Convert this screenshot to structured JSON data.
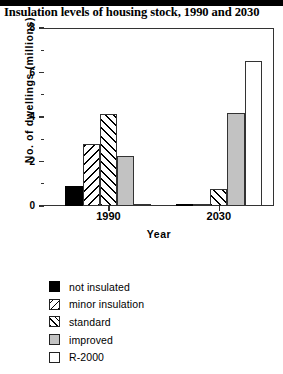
{
  "title": "Insulation levels of housing stock, 1990 and 2030",
  "chart_data": {
    "type": "bar",
    "title": "Insulation levels of housing stock, 1990 and 2030",
    "xlabel": "Year",
    "ylabel": "No.  of  dwellings  (millions)",
    "categories": [
      "1990",
      "2030"
    ],
    "ylim": [
      0,
      8
    ],
    "yticks": [
      "0",
      "2",
      "4",
      "6",
      "8"
    ],
    "ytick_values": [
      0,
      2,
      4,
      6,
      8
    ],
    "yminor_values": [
      1,
      3,
      5,
      7
    ],
    "grid": false,
    "legend_position": "below",
    "series": [
      {
        "name": "not insulated",
        "values": [
          0.9,
          0.05
        ],
        "fill": "solid-black"
      },
      {
        "name": "minor insulation",
        "values": [
          2.8,
          0.05
        ],
        "fill": "backslash-hatch"
      },
      {
        "name": "standard",
        "values": [
          4.15,
          0.75
        ],
        "fill": "forwardslash-hatch"
      },
      {
        "name": "improved",
        "values": [
          2.25,
          4.2
        ],
        "fill": "gray"
      },
      {
        "name": "R-2000",
        "values": [
          0.05,
          6.5
        ],
        "fill": "white"
      }
    ]
  },
  "legend": {
    "items": [
      {
        "label": "not insulated"
      },
      {
        "label": "minor insulation"
      },
      {
        "label": "standard"
      },
      {
        "label": "improved"
      },
      {
        "label": "R-2000"
      }
    ]
  },
  "colors": {
    "not_insulated": "#000000",
    "improved": "#c2c2c2",
    "r2000": "#ffffff",
    "axis": "#333333"
  }
}
